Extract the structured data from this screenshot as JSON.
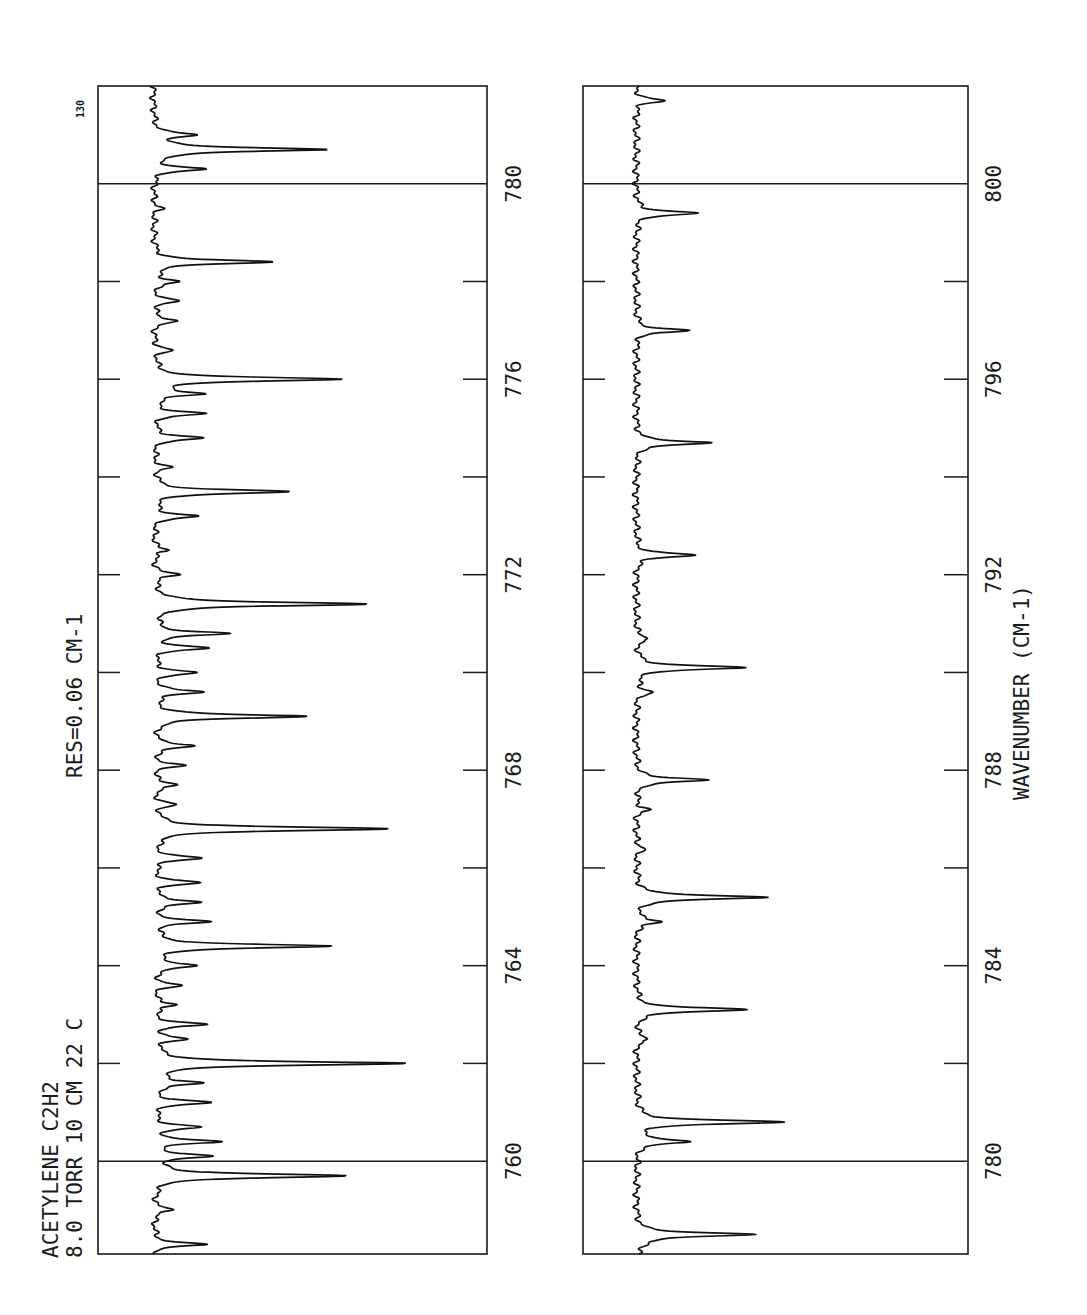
{
  "chart_data": [
    {
      "type": "line",
      "orientation": "rotated-90",
      "title": "ACETYLENE C2H2 8.0 TORR 10 CM 22 C",
      "annotations": [
        "ACETYLENE",
        "C2H2",
        "8.0 TORR",
        "10 CM",
        "22 C",
        "RES=0.06 CM-1",
        "130"
      ],
      "xlabel": "",
      "ylabel": "",
      "xlim": [
        758.1,
        782.0
      ],
      "tick_labels": [
        "760",
        "764",
        "768",
        "772",
        "776",
        "780"
      ],
      "ticks": [
        760,
        762,
        764,
        766,
        768,
        770,
        772,
        774,
        776,
        778,
        780
      ],
      "major_lines": [
        760,
        780
      ],
      "grid": false,
      "series": [
        {
          "name": "absorbance",
          "peaks": [
            {
              "x": 758.3,
              "y": 0.2
            },
            {
              "x": 759.0,
              "y": 0.08
            },
            {
              "x": 759.7,
              "y": 0.78
            },
            {
              "x": 760.1,
              "y": 0.22
            },
            {
              "x": 760.4,
              "y": 0.25
            },
            {
              "x": 760.7,
              "y": 0.18
            },
            {
              "x": 761.2,
              "y": 0.22
            },
            {
              "x": 761.6,
              "y": 0.19
            },
            {
              "x": 762.0,
              "y": 1.0
            },
            {
              "x": 762.5,
              "y": 0.12
            },
            {
              "x": 762.8,
              "y": 0.2
            },
            {
              "x": 763.2,
              "y": 0.09
            },
            {
              "x": 763.6,
              "y": 0.1
            },
            {
              "x": 764.0,
              "y": 0.18
            },
            {
              "x": 764.4,
              "y": 0.7
            },
            {
              "x": 764.9,
              "y": 0.21
            },
            {
              "x": 765.3,
              "y": 0.19
            },
            {
              "x": 765.7,
              "y": 0.18
            },
            {
              "x": 766.2,
              "y": 0.19
            },
            {
              "x": 766.8,
              "y": 0.94
            },
            {
              "x": 767.3,
              "y": 0.08
            },
            {
              "x": 767.7,
              "y": 0.1
            },
            {
              "x": 768.1,
              "y": 0.11
            },
            {
              "x": 768.5,
              "y": 0.17
            },
            {
              "x": 769.1,
              "y": 0.61
            },
            {
              "x": 769.6,
              "y": 0.2
            },
            {
              "x": 770.0,
              "y": 0.17
            },
            {
              "x": 770.5,
              "y": 0.21
            },
            {
              "x": 770.8,
              "y": 0.29
            },
            {
              "x": 771.4,
              "y": 0.86
            },
            {
              "x": 772.0,
              "y": 0.1
            },
            {
              "x": 772.5,
              "y": 0.06
            },
            {
              "x": 773.2,
              "y": 0.18
            },
            {
              "x": 773.7,
              "y": 0.54
            },
            {
              "x": 774.2,
              "y": 0.06
            },
            {
              "x": 774.8,
              "y": 0.2
            },
            {
              "x": 775.3,
              "y": 0.2
            },
            {
              "x": 775.7,
              "y": 0.19
            },
            {
              "x": 776.0,
              "y": 0.76
            },
            {
              "x": 776.6,
              "y": 0.07
            },
            {
              "x": 777.2,
              "y": 0.1
            },
            {
              "x": 777.6,
              "y": 0.1
            },
            {
              "x": 778.0,
              "y": 0.1
            },
            {
              "x": 778.4,
              "y": 0.47
            },
            {
              "x": 779.5,
              "y": 0.03
            },
            {
              "x": 780.3,
              "y": 0.2
            },
            {
              "x": 780.7,
              "y": 0.7
            },
            {
              "x": 781.0,
              "y": 0.17
            }
          ]
        }
      ]
    },
    {
      "type": "line",
      "orientation": "rotated-90",
      "title": "",
      "xlabel": "WAVENUMBER (CM-1)",
      "ylabel": "",
      "xlim": [
        778.1,
        802.0
      ],
      "tick_labels": [
        "780",
        "784",
        "788",
        "792",
        "796",
        "800"
      ],
      "ticks": [
        780,
        782,
        784,
        786,
        788,
        790,
        792,
        794,
        796,
        798,
        800
      ],
      "major_lines": [
        780,
        800
      ],
      "grid": false,
      "series": [
        {
          "name": "absorbance",
          "peaks": [
            {
              "x": 778.3,
              "y": 0.05
            },
            {
              "x": 778.5,
              "y": 0.68
            },
            {
              "x": 780.4,
              "y": 0.32
            },
            {
              "x": 780.8,
              "y": 0.83
            },
            {
              "x": 782.5,
              "y": 0.08
            },
            {
              "x": 783.1,
              "y": 0.64
            },
            {
              "x": 784.9,
              "y": 0.15
            },
            {
              "x": 785.4,
              "y": 0.76
            },
            {
              "x": 786.4,
              "y": 0.05
            },
            {
              "x": 787.2,
              "y": 0.07
            },
            {
              "x": 787.8,
              "y": 0.42
            },
            {
              "x": 789.6,
              "y": 0.1
            },
            {
              "x": 790.1,
              "y": 0.62
            },
            {
              "x": 790.7,
              "y": 0.08
            },
            {
              "x": 792.4,
              "y": 0.34
            },
            {
              "x": 794.7,
              "y": 0.44
            },
            {
              "x": 797.0,
              "y": 0.29
            },
            {
              "x": 799.4,
              "y": 0.36
            },
            {
              "x": 801.7,
              "y": 0.16
            }
          ]
        }
      ]
    }
  ],
  "labels": {
    "line1": "ACETYLENE   C2H2",
    "line2": "8.0 TORR   10 CM   22 C",
    "resolution": "RES=0.06 CM-1",
    "corner_code": "130",
    "xaxis_title": "WAVENUMBER (CM-1)"
  },
  "left_ticks": [
    "760",
    "764",
    "768",
    "772",
    "776",
    "780"
  ],
  "right_ticks": [
    "780",
    "784",
    "788",
    "792",
    "796",
    "800"
  ]
}
